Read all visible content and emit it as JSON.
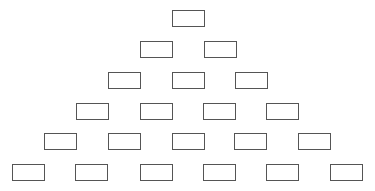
{
  "diagram": {
    "type": "pyramid",
    "rows": [
      {
        "count": 1,
        "y": 10,
        "x": [
          172
        ]
      },
      {
        "count": 2,
        "y": 41,
        "x": [
          140,
          204
        ]
      },
      {
        "count": 3,
        "y": 72,
        "x": [
          108,
          172,
          235
        ]
      },
      {
        "count": 4,
        "y": 103,
        "x": [
          76,
          140,
          203,
          266
        ]
      },
      {
        "count": 5,
        "y": 133,
        "x": [
          44,
          108,
          172,
          234,
          298
        ]
      },
      {
        "count": 6,
        "y": 164,
        "x": [
          12,
          75,
          140,
          203,
          266,
          330
        ]
      }
    ],
    "box_color": "#555555"
  }
}
